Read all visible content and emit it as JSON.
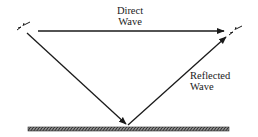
{
  "diagram": {
    "type": "two-ray propagation",
    "labels": {
      "direct": {
        "line1": "Direct",
        "line2": "Wave"
      },
      "reflected": {
        "line1": "Reflected",
        "line2": "Wave"
      }
    },
    "elements": {
      "transmitter": {
        "name": "transmitting-antenna",
        "x": 22,
        "y": 29
      },
      "receiver": {
        "name": "receiving-antenna",
        "x": 234,
        "y": 29
      },
      "direct_path": {
        "from": [
          38,
          31
        ],
        "to": [
          222,
          31
        ],
        "arrow": "end"
      },
      "incident_path": {
        "from": [
          27,
          33
        ],
        "to": [
          127,
          125
        ],
        "arrow": "end"
      },
      "reflected_path": {
        "from": [
          127,
          125
        ],
        "to": [
          227,
          36
        ],
        "arrow": "end"
      },
      "ground": {
        "x": 28,
        "y": 127,
        "width": 200,
        "height": 4,
        "pattern": "hatched"
      }
    },
    "colors": {
      "line": "#1a1a1a",
      "ground_fill": "#555555",
      "background": "#ffffff"
    }
  }
}
